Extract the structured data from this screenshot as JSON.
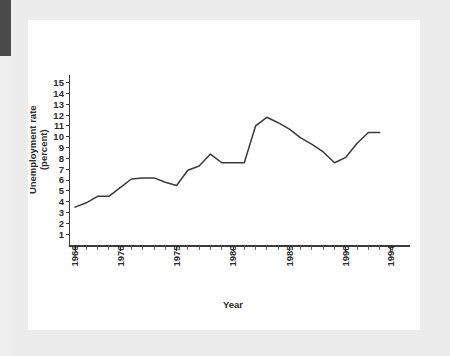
{
  "figure": {
    "background_color": "#ffffff",
    "mat_color": "#ececec",
    "edge_tab_color": "#4b4b4b",
    "line_color": "#3a3a3a",
    "axis_color": "#3b3b3b"
  },
  "chart_data": {
    "type": "line",
    "title": "",
    "xlabel": "Year",
    "ylabel": "Unemployment rate\n(percent)",
    "ylabel_line1": "Unemployment rate",
    "ylabel_line2": "(percent)",
    "xlim": [
      1965.2,
      1994.8
    ],
    "ylim": [
      0,
      15.8
    ],
    "grid": false,
    "legend": null,
    "y_ticks": [
      1,
      2,
      3,
      4,
      5,
      6,
      7,
      8,
      9,
      10,
      11,
      12,
      13,
      14,
      15
    ],
    "y_tick_labels": [
      "1",
      "2",
      "3",
      "4",
      "5",
      "6",
      "7",
      "8",
      "9",
      "10",
      "11",
      "12",
      "13",
      "14",
      "15"
    ],
    "x_ticks": [
      1966,
      1967,
      1968,
      1969,
      1970,
      1971,
      1972,
      1973,
      1974,
      1975,
      1976,
      1977,
      1978,
      1979,
      1980,
      1981,
      1982,
      1983,
      1984,
      1985,
      1986,
      1987,
      1988,
      1989,
      1990,
      1991,
      1992,
      1993,
      1994
    ],
    "x_tick_labels_shown": [
      "1966",
      "1970",
      "1975",
      "1980",
      "1985",
      "1990",
      "1994"
    ],
    "x_labeled_ticks": [
      1966,
      1970,
      1975,
      1980,
      1985,
      1990,
      1994
    ],
    "series": [
      {
        "name": "Unemployment rate",
        "x": [
          1966,
          1967,
          1968,
          1969,
          1970,
          1971,
          1972,
          1973,
          1974,
          1975,
          1976,
          1977,
          1978,
          1979,
          1980,
          1981,
          1982,
          1983,
          1984,
          1985,
          1986,
          1987,
          1988,
          1989,
          1990,
          1991,
          1992,
          1993
        ],
        "values": [
          3.5,
          3.9,
          4.5,
          4.5,
          5.3,
          6.1,
          6.2,
          6.2,
          5.8,
          5.5,
          6.9,
          7.3,
          8.4,
          7.6,
          7.6,
          7.6,
          11.0,
          11.8,
          11.3,
          10.7,
          9.9,
          9.3,
          8.6,
          7.6,
          8.1,
          9.4,
          10.4,
          10.4
        ]
      }
    ]
  }
}
